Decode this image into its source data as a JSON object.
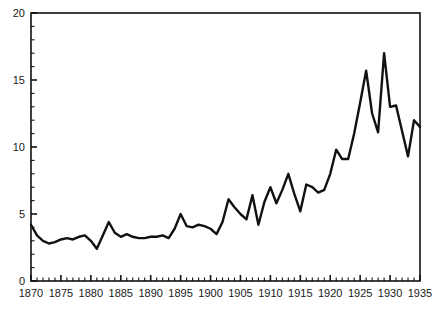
{
  "chart_data": {
    "type": "line",
    "title": "",
    "subtitle": "",
    "xlabel": "",
    "ylabel": "",
    "xlim": [
      1870,
      1935
    ],
    "ylim": [
      0,
      20
    ],
    "grid": false,
    "legend": null,
    "y_ticks_major": [
      0,
      5,
      10,
      15,
      20
    ],
    "y_ticks_minor_step": 1,
    "x_ticks_major": [
      1870,
      1875,
      1880,
      1885,
      1890,
      1895,
      1900,
      1905,
      1910,
      1915,
      1920,
      1925,
      1930,
      1935
    ],
    "x_ticks_minor_step": 1,
    "x_tick_labels": [
      "1870",
      "1875",
      "1880",
      "1885",
      "1890",
      "1895",
      "1900",
      "1905",
      "1910",
      "1915",
      "1920",
      "1925",
      "1930",
      "1935"
    ],
    "y_tick_labels": [
      "0",
      "5",
      "10",
      "15",
      "20"
    ],
    "line_color": "#111111",
    "axis_color": "#111111",
    "background_color": "#ffffff",
    "series": [
      {
        "name": "series-1",
        "x": [
          1870,
          1871,
          1872,
          1873,
          1874,
          1875,
          1876,
          1877,
          1878,
          1879,
          1880,
          1881,
          1882,
          1883,
          1884,
          1885,
          1886,
          1887,
          1888,
          1889,
          1890,
          1891,
          1892,
          1893,
          1894,
          1895,
          1896,
          1897,
          1898,
          1899,
          1900,
          1901,
          1902,
          1903,
          1904,
          1905,
          1906,
          1907,
          1908,
          1909,
          1910,
          1911,
          1912,
          1913,
          1914,
          1915,
          1916,
          1917,
          1918,
          1919,
          1920,
          1921,
          1922,
          1923,
          1924,
          1925,
          1926,
          1927,
          1928,
          1929,
          1930,
          1931,
          1932,
          1933,
          1934,
          1935
        ],
        "y": [
          4.2,
          3.4,
          3.0,
          2.8,
          2.9,
          3.1,
          3.2,
          3.1,
          3.3,
          3.4,
          3.0,
          2.4,
          3.4,
          4.4,
          3.6,
          3.3,
          3.5,
          3.3,
          3.2,
          3.2,
          3.3,
          3.3,
          3.4,
          3.2,
          3.9,
          5.0,
          4.1,
          4.0,
          4.2,
          4.1,
          3.9,
          3.5,
          4.4,
          6.1,
          5.5,
          5.0,
          4.6,
          6.4,
          4.2,
          5.9,
          7.0,
          5.8,
          6.8,
          8.0,
          6.5,
          5.2,
          7.2,
          7.0,
          6.6,
          6.8,
          8.0,
          9.8,
          9.1,
          9.1,
          11.0,
          13.3,
          15.7,
          12.5,
          11.1,
          17.0,
          13.0,
          13.1,
          11.2,
          9.3,
          12.0,
          11.5
        ]
      }
    ]
  },
  "axes": {
    "x_axis_name": "year-axis",
    "y_axis_name": "value-axis"
  }
}
